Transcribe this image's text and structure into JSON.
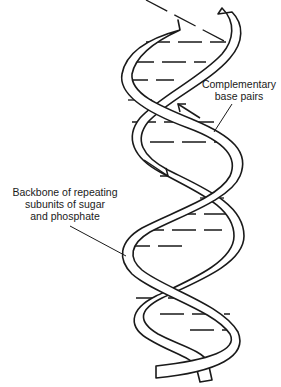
{
  "figure": {
    "labels": {
      "base_pairs": {
        "line1": "Complementary",
        "line2": "base pairs"
      },
      "backbone": {
        "line1": "Backbone of repeating",
        "line2": "subunits of sugar",
        "line3": "and phosphate"
      }
    },
    "annotations": {
      "strand_direction_up": "arrow-up-left",
      "strand_direction_down": "arrow-down-right"
    },
    "colors": {
      "line": "#1a1a1a",
      "background": "#ffffff"
    }
  }
}
